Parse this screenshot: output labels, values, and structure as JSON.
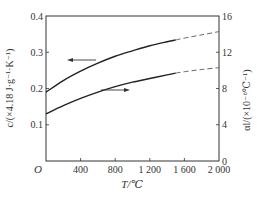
{
  "chart_data": {
    "type": "line",
    "title": "",
    "xlabel": "T/℃",
    "ylabel_left": "c/(×4.18 J·g⁻¹·K⁻¹)",
    "ylabel_right": "αl/(×10⁻⁶℃⁻¹)",
    "xlim": [
      0,
      2000
    ],
    "ylim_left": [
      0,
      0.4
    ],
    "ylim_right": [
      0,
      16
    ],
    "x_ticks": [
      "O",
      "400",
      "800",
      "1 200",
      "1 600",
      "2 000"
    ],
    "x_tick_values": [
      0,
      400,
      800,
      1200,
      1600,
      2000
    ],
    "y_left_ticks": [
      "0.1",
      "0.2",
      "0.3",
      "0.4"
    ],
    "y_left_tick_values": [
      0.1,
      0.2,
      0.3,
      0.4
    ],
    "y_right_ticks": [
      "0",
      "4",
      "8",
      "12",
      "16"
    ],
    "y_right_tick_values": [
      0,
      4,
      8,
      12,
      16
    ],
    "grid": false,
    "series": [
      {
        "name": "specific heat c",
        "axis": "left",
        "arrow": "left",
        "x": [
          0,
          200,
          400,
          600,
          800,
          1000,
          1200,
          1400,
          1500,
          1600,
          1800,
          2000
        ],
        "values": [
          0.19,
          0.222,
          0.248,
          0.27,
          0.289,
          0.304,
          0.318,
          0.329,
          0.334,
          0.339,
          0.348,
          0.357
        ],
        "solid_until": 1500,
        "dashed_after": 1500
      },
      {
        "name": "linear expansion coefficient αl",
        "axis": "right",
        "arrow": "right",
        "x": [
          0,
          200,
          400,
          600,
          800,
          1000,
          1200,
          1400,
          1500,
          1600,
          1800,
          2000
        ],
        "values": [
          5.2,
          6.1,
          6.9,
          7.6,
          8.2,
          8.7,
          9.1,
          9.5,
          9.7,
          9.85,
          10.1,
          10.3
        ],
        "solid_until": 1500,
        "dashed_after": 1500
      }
    ]
  }
}
